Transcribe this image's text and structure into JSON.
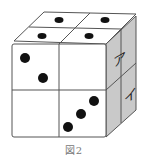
{
  "figure": {
    "caption": "図2",
    "colors": {
      "face_white": "#ffffff",
      "face_side": "#c9c9c9",
      "edge": "#555555",
      "pip": "#111111",
      "caption": "#777777"
    },
    "top_face": {
      "cells": [
        {
          "position": "back-left",
          "pips": 1
        },
        {
          "position": "back-right",
          "pips": 1
        },
        {
          "position": "front-left",
          "pips": 1
        },
        {
          "position": "front-right",
          "pips": 1
        }
      ]
    },
    "front_face": {
      "cells": [
        {
          "position": "top-left",
          "pips": 2
        },
        {
          "position": "top-right",
          "pips": 0
        },
        {
          "position": "bottom-left",
          "pips": 0
        },
        {
          "position": "bottom-right",
          "pips": 3
        }
      ]
    },
    "right_face": {
      "labels": [
        {
          "position": "upper",
          "text": "ア"
        },
        {
          "position": "lower",
          "text": "イ"
        }
      ]
    }
  }
}
